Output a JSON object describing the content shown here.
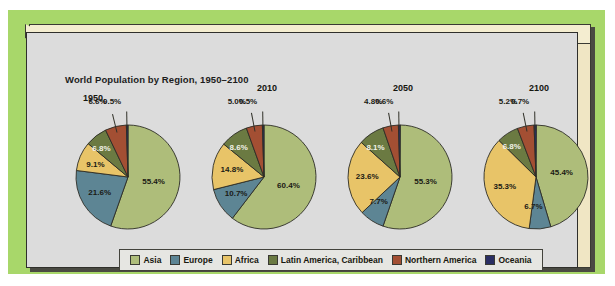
{
  "figure": {
    "title": "World Population by Region, 1950–2100",
    "attribution": "Adapted from the United Nations Population Division."
  },
  "legend": {
    "position": "bottom-center",
    "items": [
      {
        "label": "Asia",
        "color": "#aebd7a"
      },
      {
        "label": "Europe",
        "color": "#5d8594"
      },
      {
        "label": "Africa",
        "color": "#e8c468"
      },
      {
        "label": "Latin America, Caribbean",
        "color": "#6b7a42"
      },
      {
        "label": "Northern America",
        "color": "#a34f33"
      },
      {
        "label": "Oceania",
        "color": "#2b2f63"
      }
    ]
  },
  "chart_data": {
    "type": "pie",
    "title": "World Population by Region, 1950–2100",
    "xlabel": "",
    "ylabel": "",
    "units": "percent of world population",
    "categories": [
      "Asia",
      "Europe",
      "Africa",
      "Latin America, Caribbean",
      "Northern America",
      "Oceania"
    ],
    "colors": [
      "#aebd7a",
      "#5d8594",
      "#e8c468",
      "#6b7a42",
      "#a34f33",
      "#2b2f63"
    ],
    "panels": [
      {
        "year": "1950",
        "slices": [
          {
            "name": "Asia",
            "value": 55.4,
            "label": "55.4%"
          },
          {
            "name": "Europe",
            "value": 21.6,
            "label": "21.6%"
          },
          {
            "name": "Africa",
            "value": 9.1,
            "label": "9.1%"
          },
          {
            "name": "Latin America, Caribbean",
            "value": 6.8,
            "label": "6.8%"
          },
          {
            "name": "Northern America",
            "value": 6.6,
            "label": "6.6%"
          },
          {
            "name": "Oceania",
            "value": 0.5,
            "label": "0.5%"
          }
        ]
      },
      {
        "year": "2010",
        "slices": [
          {
            "name": "Asia",
            "value": 60.4,
            "label": "60.4%"
          },
          {
            "name": "Europe",
            "value": 10.7,
            "label": "10.7%"
          },
          {
            "name": "Africa",
            "value": 14.8,
            "label": "14.8%"
          },
          {
            "name": "Latin America, Caribbean",
            "value": 8.6,
            "label": "8.6%"
          },
          {
            "name": "Northern America",
            "value": 5.0,
            "label": "5.0%"
          },
          {
            "name": "Oceania",
            "value": 0.5,
            "label": "0.5%"
          }
        ]
      },
      {
        "year": "2050",
        "slices": [
          {
            "name": "Asia",
            "value": 55.3,
            "label": "55.3%"
          },
          {
            "name": "Europe",
            "value": 7.7,
            "label": "7.7%"
          },
          {
            "name": "Africa",
            "value": 23.6,
            "label": "23.6%"
          },
          {
            "name": "Latin America, Caribbean",
            "value": 8.1,
            "label": "8.1%"
          },
          {
            "name": "Northern America",
            "value": 4.8,
            "label": "4.8%"
          },
          {
            "name": "Oceania",
            "value": 0.6,
            "label": "0.6%"
          }
        ]
      },
      {
        "year": "2100",
        "slices": [
          {
            "name": "Asia",
            "value": 45.4,
            "label": "45.4%"
          },
          {
            "name": "Europe",
            "value": 6.7,
            "label": "6.7%"
          },
          {
            "name": "Africa",
            "value": 35.3,
            "label": "35.3%"
          },
          {
            "name": "Latin America, Caribbean",
            "value": 6.8,
            "label": "6.8%"
          },
          {
            "name": "Northern America",
            "value": 5.2,
            "label": "5.2%"
          },
          {
            "name": "Oceania",
            "value": 0.7,
            "label": "0.7%"
          }
        ]
      }
    ]
  }
}
